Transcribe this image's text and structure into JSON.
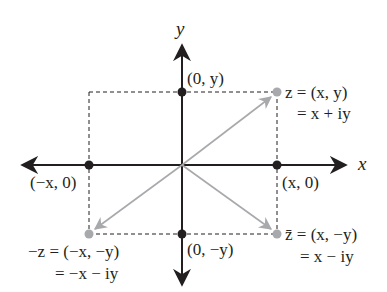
{
  "diagram": {
    "title": "",
    "axes": {
      "x_label": "x",
      "y_label": "y"
    },
    "points": {
      "z": {
        "label_line1": "z = (x, y)",
        "label_line2": "= x + iy",
        "color": "#a7a9ac"
      },
      "z_conj": {
        "label_line1": "z̄ = (x, −y)",
        "label_line2": "= x − iy",
        "color": "#a7a9ac"
      },
      "neg_z": {
        "label_line1": "−z = (−x, −y)",
        "label_line2": "= −x − iy",
        "color": "#a7a9ac"
      },
      "y_pos": {
        "label": "(0, y)",
        "color": "#231f20"
      },
      "y_neg": {
        "label": "(0, −y)",
        "color": "#231f20"
      },
      "x_pos": {
        "label": "(x, 0)",
        "color": "#231f20"
      },
      "x_neg": {
        "label": "(−x, 0)",
        "color": "#231f20"
      }
    },
    "colors": {
      "axis": "#231f20",
      "vector": "#a7a9ac",
      "dashed": "#231f20"
    }
  }
}
